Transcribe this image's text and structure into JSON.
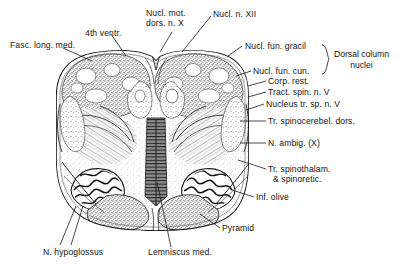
{
  "figure": {
    "background_color": "#ffffff",
    "ink_color": "#1a1a1a",
    "labels": [
      {
        "id": "fasc-long-med",
        "text": "Fasc. long. med.",
        "x": 10,
        "y": 40,
        "align": "left"
      },
      {
        "id": "fourth-ventr",
        "text": "4th ventr.",
        "x": 85,
        "y": 28,
        "align": "left"
      },
      {
        "id": "nucl-mot-dors-n-x",
        "text": "Nucl. mot.\ndors. n. X",
        "x": 146,
        "y": 8,
        "align": "left"
      },
      {
        "id": "nucl-n-xii",
        "text": "Nucl. n. XII",
        "x": 213,
        "y": 9,
        "align": "left"
      },
      {
        "id": "nucl-fun-gracil",
        "text": "Nucl. fun. gracil",
        "x": 245,
        "y": 43,
        "align": "left"
      },
      {
        "id": "nucl-fun-cun",
        "text": "Nucl. fun. cun.",
        "x": 253,
        "y": 68,
        "align": "left"
      },
      {
        "id": "corp-rest",
        "text": "Corp. rest.",
        "x": 268,
        "y": 79,
        "align": "left"
      },
      {
        "id": "tract-spin-n-v",
        "text": "Tract. spin. n. V",
        "x": 268,
        "y": 90,
        "align": "left"
      },
      {
        "id": "nucleus-tr-sp-n-v",
        "text": "Nucleus tr. sp. n. V",
        "x": 266,
        "y": 101,
        "align": "left"
      },
      {
        "id": "tr-spinocerebel-dors",
        "text": "Tr. spinocerebel. dors.",
        "x": 268,
        "y": 118,
        "align": "left"
      },
      {
        "id": "n-ambig-x",
        "text": "N. ambig. (X)",
        "x": 268,
        "y": 140,
        "align": "left"
      },
      {
        "id": "tr-spinothalam",
        "text": "Tr. spinothalam.\n  & spinoretic.",
        "x": 268,
        "y": 166,
        "align": "left"
      },
      {
        "id": "inf-olive",
        "text": "Inf. olive",
        "x": 256,
        "y": 194,
        "align": "left"
      },
      {
        "id": "pyramid",
        "text": "Pyramid",
        "x": 222,
        "y": 225,
        "align": "left"
      },
      {
        "id": "lemniscus-med",
        "text": "Lemniscus med.",
        "x": 148,
        "y": 249,
        "align": "left"
      },
      {
        "id": "n-hypoglossus",
        "text": "N. hypoglossus",
        "x": 43,
        "y": 249,
        "align": "left"
      }
    ],
    "group_label": {
      "id": "dorsal-column-nuclei",
      "text": "Dorsal column\nnuclei",
      "x": 334,
      "y": 52,
      "brace_top": 45,
      "brace_bottom": 74
    }
  }
}
